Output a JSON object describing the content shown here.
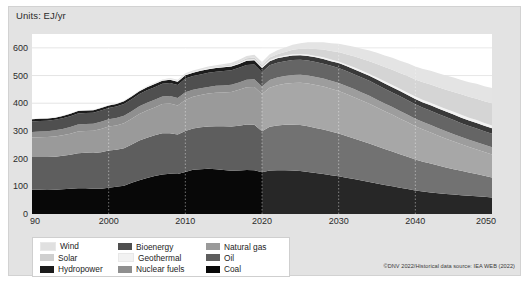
{
  "figure": {
    "units_label": "Units: EJ/yr",
    "credit": "©DNV 2022/Historical data source: IEA WEB (2022)",
    "caption": "Figure 7.2  World Primary Energy by Source/Carrier, Total Her Andrii Fluids",
    "colors": {
      "card_bg": "#e3e3e3",
      "plot_bg": "#ffffff",
      "grid": "#d8d8d8",
      "forecast_overlay": "#ffffff",
      "wind": "#e0e0e0",
      "solar": "#cfcfcf",
      "hydropower": "#1c1c1c",
      "bioenergy": "#4f4f4f",
      "geothermal": "#f2f2f2",
      "nuclear_fuels": "#8f8f8f",
      "natural_gas": "#9a9a9a",
      "oil": "#5e5e5e",
      "coal": "#080808"
    }
  },
  "legend": {
    "items": [
      {
        "label": "Wind",
        "color_key": "wind",
        "column": 1,
        "row": 1
      },
      {
        "label": "Bioenergy",
        "color_key": "bioenergy",
        "column": 2,
        "row": 1
      },
      {
        "label": "Natural gas",
        "color_key": "natural_gas",
        "column": 3,
        "row": 1
      },
      {
        "label": "Solar",
        "color_key": "solar",
        "column": 1,
        "row": 2
      },
      {
        "label": "Geothermal",
        "color_key": "geothermal",
        "column": 2,
        "row": 2
      },
      {
        "label": "Oil",
        "color_key": "oil",
        "column": 3,
        "row": 2
      },
      {
        "label": "Hydropower",
        "color_key": "hydropower",
        "column": 1,
        "row": 3
      },
      {
        "label": "Nuclear fuels",
        "color_key": "nuclear_fuels",
        "column": 2,
        "row": 3
      },
      {
        "label": "Coal",
        "color_key": "coal",
        "column": 3,
        "row": 3
      }
    ]
  },
  "chart_data": {
    "type": "area",
    "stacked": true,
    "title": "",
    "subtitle": "",
    "xlabel": "",
    "ylabel": "Units: EJ/yr",
    "xlim": [
      1990,
      2050
    ],
    "ylim": [
      0,
      650
    ],
    "yticks": [
      0,
      100,
      200,
      300,
      400,
      500,
      600
    ],
    "ytick_labels": [
      "0",
      "100",
      "200",
      "300",
      "400",
      "500",
      "600"
    ],
    "xticks": [
      1990,
      2000,
      2010,
      2020,
      2030,
      2040,
      2050
    ],
    "xtick_labels": [
      "90",
      "2000",
      "2010",
      "2020",
      "2030",
      "2040",
      "2050"
    ],
    "grid": true,
    "legend_position": "below-left",
    "history_forecast_split_year": 2020,
    "x": [
      1990,
      1991,
      1992,
      1993,
      1994,
      1995,
      1996,
      1997,
      1998,
      1999,
      2000,
      2001,
      2002,
      2003,
      2004,
      2005,
      2006,
      2007,
      2008,
      2009,
      2010,
      2011,
      2012,
      2013,
      2014,
      2015,
      2016,
      2017,
      2018,
      2019,
      2020,
      2021,
      2022,
      2023,
      2024,
      2025,
      2026,
      2027,
      2028,
      2029,
      2030,
      2031,
      2032,
      2033,
      2034,
      2035,
      2036,
      2037,
      2038,
      2039,
      2040,
      2041,
      2042,
      2043,
      2044,
      2045,
      2046,
      2047,
      2048,
      2049,
      2050
    ],
    "stack_order_bottom_to_top": [
      "Coal",
      "Oil",
      "Natural gas",
      "Nuclear fuels",
      "Bioenergy",
      "Hydropower",
      "Geothermal",
      "Solar",
      "Wind"
    ],
    "series": [
      {
        "name": "Coal",
        "color_key": "coal",
        "values": [
          88,
          88,
          87,
          88,
          89,
          91,
          93,
          93,
          91,
          91,
          95,
          98,
          102,
          113,
          122,
          130,
          137,
          143,
          145,
          144,
          152,
          160,
          162,
          163,
          162,
          159,
          156,
          157,
          159,
          158,
          151,
          157,
          158,
          158,
          157,
          155,
          152,
          148,
          144,
          140,
          136,
          131,
          126,
          121,
          116,
          110,
          105,
          100,
          95,
          90,
          85,
          81,
          78,
          75,
          72,
          70,
          68,
          66,
          64,
          62,
          60
        ]
      },
      {
        "name": "Oil",
        "color_key": "oil",
        "values": [
          118,
          118,
          119,
          119,
          121,
          123,
          126,
          128,
          129,
          132,
          134,
          134,
          135,
          138,
          143,
          145,
          147,
          149,
          147,
          143,
          148,
          149,
          151,
          153,
          155,
          158,
          160,
          162,
          164,
          164,
          148,
          158,
          162,
          164,
          165,
          166,
          165,
          163,
          161,
          158,
          155,
          151,
          147,
          143,
          139,
          135,
          130,
          126,
          121,
          117,
          112,
          108,
          104,
          100,
          96,
          92,
          88,
          84,
          80,
          76,
          72
        ]
      },
      {
        "name": "Natural gas",
        "color_key": "natural_gas",
        "values": [
          70,
          71,
          72,
          73,
          74,
          76,
          79,
          79,
          81,
          84,
          87,
          88,
          91,
          93,
          96,
          99,
          101,
          105,
          107,
          105,
          112,
          114,
          117,
          119,
          121,
          122,
          125,
          130,
          135,
          137,
          134,
          141,
          145,
          148,
          151,
          153,
          154,
          155,
          155,
          154,
          153,
          151,
          149,
          146,
          143,
          140,
          136,
          132,
          128,
          124,
          120,
          116,
          112,
          108,
          104,
          100,
          96,
          92,
          89,
          86,
          83
        ]
      },
      {
        "name": "Nuclear fuels",
        "color_key": "nuclear_fuels",
        "values": [
          20,
          21,
          21,
          22,
          23,
          24,
          25,
          25,
          25,
          26,
          26,
          27,
          27,
          27,
          28,
          28,
          28,
          27,
          27,
          27,
          28,
          26,
          24,
          24,
          25,
          25,
          26,
          26,
          27,
          28,
          27,
          28,
          28,
          28,
          29,
          29,
          29,
          29,
          29,
          29,
          29,
          29,
          29,
          29,
          29,
          28,
          28,
          28,
          28,
          27,
          27,
          27,
          27,
          27,
          27,
          26,
          26,
          26,
          26,
          26,
          26
        ]
      },
      {
        "name": "Bioenergy",
        "color_key": "bioenergy",
        "values": [
          38,
          38,
          38,
          38,
          39,
          39,
          40,
          40,
          40,
          41,
          41,
          41,
          42,
          43,
          44,
          45,
          45,
          46,
          47,
          47,
          49,
          49,
          50,
          51,
          51,
          52,
          52,
          53,
          53,
          53,
          52,
          53,
          53,
          54,
          54,
          54,
          54,
          54,
          54,
          54,
          54,
          54,
          54,
          54,
          54,
          54,
          53,
          53,
          53,
          53,
          52,
          52,
          52,
          51,
          51,
          51,
          50,
          50,
          50,
          49,
          49
        ]
      },
      {
        "name": "Hydropower",
        "color_key": "hydropower",
        "values": [
          8,
          8,
          8,
          8,
          8,
          9,
          9,
          9,
          9,
          9,
          9,
          9,
          10,
          10,
          10,
          11,
          11,
          11,
          12,
          12,
          12,
          12,
          13,
          13,
          13,
          14,
          14,
          14,
          15,
          15,
          15,
          15,
          16,
          16,
          16,
          16,
          17,
          17,
          17,
          17,
          18,
          18,
          18,
          18,
          18,
          19,
          19,
          19,
          19,
          19,
          19,
          19,
          20,
          20,
          20,
          20,
          20,
          20,
          20,
          20,
          20
        ]
      },
      {
        "name": "Geothermal",
        "color_key": "geothermal",
        "values": [
          2,
          2,
          2,
          2,
          2,
          2,
          2,
          2,
          2,
          2,
          2,
          2,
          2,
          2,
          2,
          3,
          3,
          3,
          3,
          3,
          3,
          3,
          3,
          3,
          3,
          3,
          3,
          3,
          4,
          4,
          4,
          4,
          4,
          4,
          5,
          5,
          5,
          5,
          6,
          6,
          6,
          6,
          7,
          7,
          7,
          7,
          8,
          8,
          8,
          8,
          9,
          9,
          9,
          9,
          9,
          10,
          10,
          10,
          10,
          10,
          10
        ]
      },
      {
        "name": "Solar",
        "color_key": "solar",
        "values": [
          0,
          0,
          0,
          0,
          0,
          0,
          0,
          0,
          0,
          0,
          0,
          0,
          0,
          0,
          0,
          0,
          0,
          0,
          1,
          1,
          1,
          1,
          1,
          2,
          2,
          3,
          3,
          4,
          5,
          6,
          7,
          9,
          11,
          13,
          16,
          19,
          22,
          25,
          28,
          31,
          34,
          37,
          40,
          43,
          46,
          49,
          52,
          55,
          57,
          60,
          62,
          64,
          66,
          68,
          70,
          72,
          74,
          75,
          77,
          78,
          80
        ]
      },
      {
        "name": "Wind",
        "color_key": "wind",
        "values": [
          0,
          0,
          0,
          0,
          0,
          0,
          0,
          0,
          0,
          0,
          0,
          0,
          1,
          1,
          1,
          1,
          2,
          2,
          2,
          3,
          3,
          4,
          4,
          5,
          5,
          6,
          7,
          8,
          9,
          10,
          11,
          12,
          14,
          16,
          18,
          20,
          22,
          24,
          26,
          28,
          30,
          32,
          34,
          36,
          38,
          40,
          41,
          43,
          44,
          46,
          47,
          48,
          49,
          50,
          51,
          52,
          52,
          53,
          54,
          54,
          55
        ]
      }
    ],
    "totals_note": "Stacked totals peak near 595 EJ/yr in 2019, dip to ~560 in 2020 (COVID), re-peak ~590 around 2025, then decline to ~445 by 2050."
  }
}
